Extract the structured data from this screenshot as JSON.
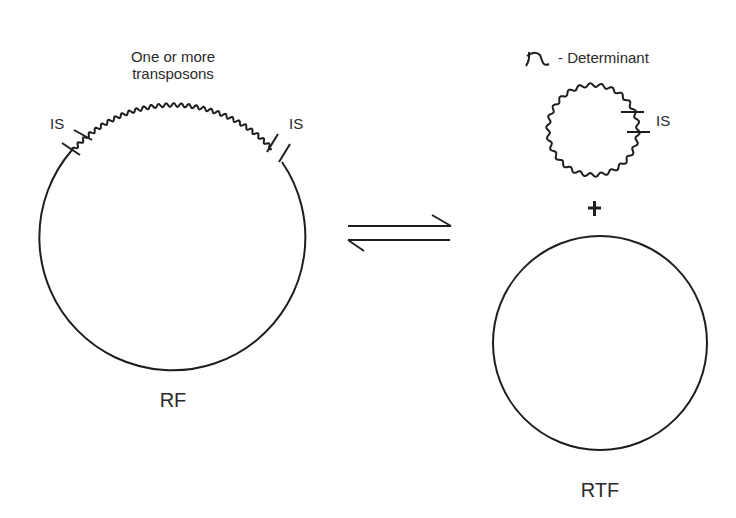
{
  "figure": {
    "left": {
      "name": "RF",
      "label": "RF",
      "transposon_label_line1": "One or more",
      "transposon_label_line2": "transposons",
      "is_left_label": "IS",
      "is_right_label": "IS"
    },
    "equilibrium": {
      "symbol": "reversible-arrows"
    },
    "right": {
      "determinant_symbol": "r",
      "determinant_label": "- Determinant",
      "is_label": "IS",
      "plus": "+",
      "label": "RTF"
    },
    "colors": {
      "stroke": "#1e1e1e",
      "text": "#2a2a2a",
      "background": "#ffffff"
    }
  }
}
